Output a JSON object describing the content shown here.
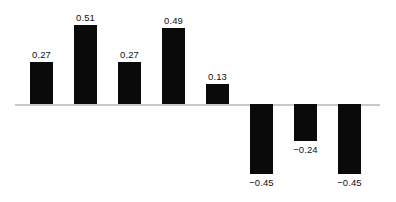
{
  "chart_data": {
    "type": "bar",
    "title": "",
    "subtitle": "",
    "xlabel": "",
    "ylabel": "",
    "categories": [
      "1",
      "2",
      "3",
      "4",
      "5",
      "6",
      "7",
      "8"
    ],
    "values": [
      0.27,
      0.51,
      0.27,
      0.49,
      0.13,
      -0.45,
      -0.24,
      -0.45
    ],
    "labels": [
      "0.27",
      "0.51",
      "0.27",
      "0.49",
      "0.13",
      "−0.45",
      "−0.24",
      "−0.45"
    ],
    "ylim": [
      -0.55,
      0.58
    ],
    "grid": false,
    "legend": false,
    "legend_position": "none",
    "axis_visible": false,
    "zero_line": true,
    "tick_labels_x": [],
    "tick_labels_y": [],
    "annotations": [],
    "colors": {
      "bar": "#0a0a0a",
      "zero_line": "#c9c9c9",
      "label_text": "#111111",
      "background": "#ffffff"
    }
  },
  "layout": {
    "width": 396,
    "height": 202,
    "baseline_y": 104,
    "bar_width": 23,
    "bar_pitch": 44,
    "first_bar_x": 30,
    "unit_px": 155
  }
}
